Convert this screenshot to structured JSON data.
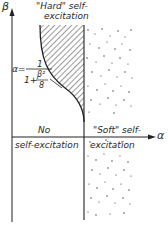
{
  "axes": {
    "y_label": "β",
    "x_label": "α"
  },
  "regions": {
    "hard": {
      "line1": "\"Hard\" self-",
      "line2": "excitation"
    },
    "none": {
      "line1": "No",
      "line2": "self-excitation"
    },
    "soft": {
      "line1": "\"Soft\" self-",
      "line2": "excitation"
    }
  },
  "equation": {
    "lhs": "α=",
    "numerator": "1",
    "denominator_prefix": "1+",
    "sub_numerator": "β²",
    "sub_denominator": "8"
  },
  "colors": {
    "ink": "#2a2a2a",
    "background": "#ffffff"
  }
}
